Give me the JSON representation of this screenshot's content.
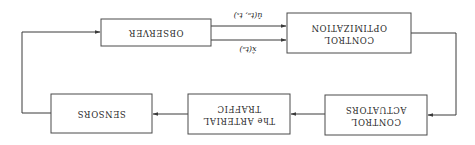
{
  "diagram": {
    "orientation": "rotated 180 degrees",
    "blocks": {
      "observer": {
        "label": "OBSERVER"
      },
      "control_optimization": {
        "line1": "CONTROL",
        "line2": "OPTIMIZATION"
      },
      "control_actuators": {
        "line1": "CONTROL",
        "line2": "ACTUATORS"
      },
      "arterial_traffic": {
        "line1": "The ARTERIAL",
        "line2": "TRAFFIC"
      },
      "sensors": {
        "label": "SENSORS"
      }
    },
    "signals": {
      "u_hat": "û(tₒ, tₓ)",
      "x_hat": "x̂(tₒ)"
    },
    "colors": {
      "stroke": "#3a3a3a",
      "text": "#2a2a2a",
      "background": "#ffffff"
    }
  }
}
